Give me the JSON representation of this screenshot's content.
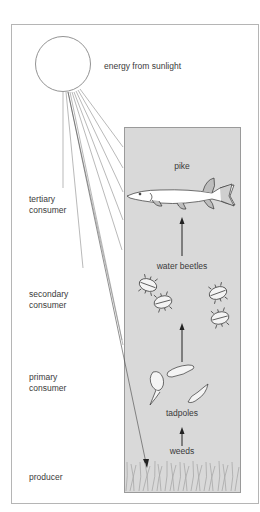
{
  "diagram": {
    "energy_label": "energy from sunlight",
    "trophic_levels": [
      {
        "id": "tertiary",
        "label_line1": "tertiary",
        "label_line2": "consumer",
        "organism": "pike"
      },
      {
        "id": "secondary",
        "label_line1": "secondary",
        "label_line2": "consumer",
        "organism": "water beetles"
      },
      {
        "id": "primary",
        "label_line1": "primary",
        "label_line2": "consumer",
        "organism": "tadpoles"
      },
      {
        "id": "producer",
        "label_line1": "producer",
        "label_line2": "",
        "organism": "weeds"
      }
    ],
    "colors": {
      "water": "#d9d9d9",
      "frame": "#b5b5b5",
      "lines": "#777777",
      "arrows": "#222222",
      "weeds": "#a8a8a8"
    }
  }
}
